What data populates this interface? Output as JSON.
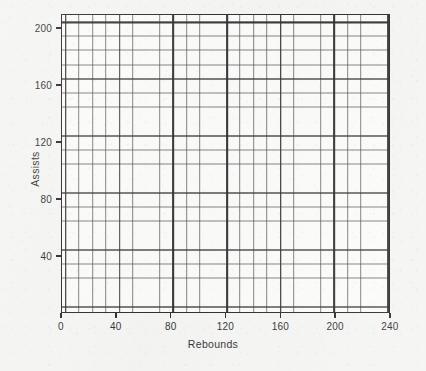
{
  "chart_data": {
    "type": "scatter",
    "title": "",
    "subtitle": "",
    "xlabel": "Rebounds",
    "ylabel": "Assists",
    "xlim": [
      0,
      240
    ],
    "ylim": [
      0,
      210
    ],
    "x_ticks": [
      0,
      40,
      80,
      120,
      160,
      200,
      240
    ],
    "x_tick_labels": [
      "0",
      "40",
      "80",
      "120",
      "160",
      "200",
      "240"
    ],
    "y_ticks": [
      40,
      80,
      120,
      160,
      200
    ],
    "y_tick_labels": [
      "40",
      "80",
      "120",
      "160",
      "200"
    ],
    "grid": true,
    "grid_minor_step_x": 10,
    "grid_minor_step_y": 10,
    "grid_major_step_x": 40,
    "grid_major_step_y": 40,
    "legend": null,
    "legend_position": "none",
    "series": [
      {
        "name": "",
        "x": [],
        "y": []
      }
    ],
    "annotations": []
  },
  "colors": {
    "page_background": "#f4f4f2",
    "plot_background": "#fbfbfa",
    "axis_line": "#1b1b1d",
    "grid_major": "#1c1c1e",
    "grid_minor": "#3c3c3e",
    "text": "#1d1d1f"
  }
}
